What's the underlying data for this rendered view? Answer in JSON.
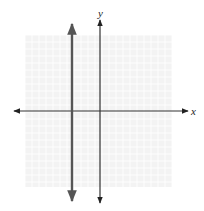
{
  "chart_data": {
    "type": "line",
    "title": "",
    "xlabel": "x",
    "ylabel": "y",
    "xlim": [
      -10,
      10
    ],
    "ylim": [
      -10,
      10
    ],
    "grid": true,
    "tick_labels": false,
    "series": [
      {
        "name": "vertical line x = -4",
        "equation": "x = -4",
        "x": [
          -4,
          -4
        ],
        "y": [
          -10.5,
          10.5
        ],
        "style": "thick, dark gray, arrows both ends"
      }
    ],
    "axes": {
      "x_axis_arrows": "both ends",
      "y_axis_arrows": "both ends"
    }
  },
  "labels": {
    "x_axis": "x",
    "y_axis": "y"
  },
  "colors": {
    "grid": "#e6e6e6",
    "grid_background": "#f2f2f2",
    "axis": "#333333",
    "line": "#555555"
  }
}
